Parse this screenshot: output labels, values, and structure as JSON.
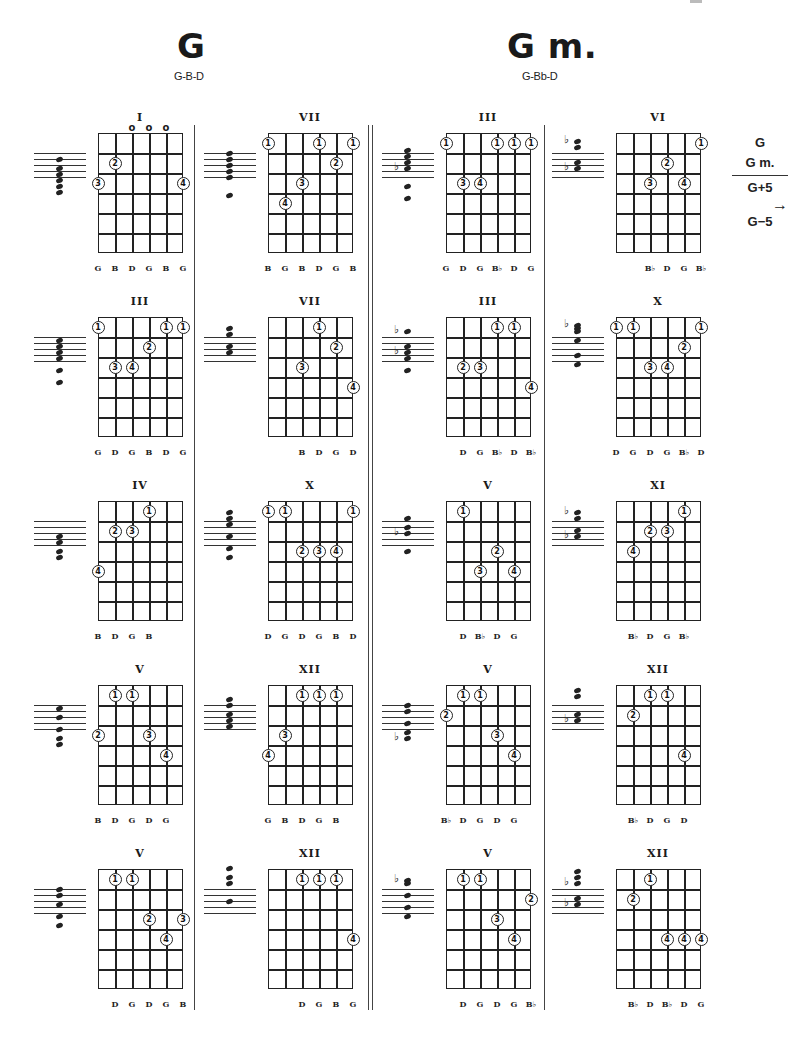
{
  "page": {
    "sections": [
      {
        "title": "G",
        "notes": "G-B-D"
      },
      {
        "title": "G m.",
        "notes": "G-Bb-D"
      }
    ],
    "legend": {
      "items": [
        "G",
        "G m.",
        "G+5",
        "G−5"
      ],
      "arrow": "→",
      "arrow_icon": "right-arrow-icon"
    }
  },
  "layout": {
    "columns_x": [
      98,
      268,
      446,
      616
    ],
    "rows_y": [
      133,
      317,
      501,
      685,
      869
    ],
    "grid_w": 85,
    "grid_h": 120,
    "strings": 6,
    "frets": 6
  },
  "diagrams": [
    {
      "col": 0,
      "row": 0,
      "section": "G",
      "position": "I",
      "open": [
        2,
        3,
        4
      ],
      "fingers": [
        {
          "s": 1,
          "f": 2,
          "n": "2"
        },
        {
          "s": 0,
          "f": 3,
          "n": "3"
        },
        {
          "s": 5,
          "f": 3,
          "n": "4"
        }
      ],
      "notes": [
        "G",
        "B",
        "D",
        "G",
        "B",
        "G"
      ],
      "notes_start": 0,
      "staff": {
        "heads": [
          2,
          5,
          7,
          9,
          11,
          13
        ],
        "flats": []
      }
    },
    {
      "col": 0,
      "row": 1,
      "section": "G",
      "position": "III",
      "open": [],
      "fingers": [
        {
          "s": 0,
          "f": 1,
          "n": "1"
        },
        {
          "s": 4,
          "f": 1,
          "n": "1"
        },
        {
          "s": 5,
          "f": 1,
          "n": "1"
        },
        {
          "s": 3,
          "f": 2,
          "n": "2"
        },
        {
          "s": 1,
          "f": 3,
          "n": "3"
        },
        {
          "s": 2,
          "f": 3,
          "n": "4"
        }
      ],
      "notes": [
        "G",
        "D",
        "G",
        "B",
        "D",
        "G"
      ],
      "notes_start": 0,
      "staff": {
        "heads": [
          1,
          3,
          5,
          7,
          11,
          15
        ],
        "flats": []
      }
    },
    {
      "col": 0,
      "row": 2,
      "section": "G",
      "position": "IV",
      "open": [],
      "fingers": [
        {
          "s": 3,
          "f": 1,
          "n": "1"
        },
        {
          "s": 1,
          "f": 2,
          "n": "2"
        },
        {
          "s": 2,
          "f": 2,
          "n": "3"
        },
        {
          "s": 0,
          "f": 4,
          "n": "4"
        }
      ],
      "notes": [
        "B",
        "D",
        "G",
        "B"
      ],
      "notes_start": 0,
      "staff": {
        "heads": [
          5,
          7,
          10,
          12
        ],
        "flats": []
      }
    },
    {
      "col": 0,
      "row": 3,
      "section": "G",
      "position": "V",
      "open": [],
      "fingers": [
        {
          "s": 1,
          "f": 1,
          "n": "1"
        },
        {
          "s": 2,
          "f": 1,
          "n": "1"
        },
        {
          "s": 0,
          "f": 3,
          "n": "2"
        },
        {
          "s": 3,
          "f": 3,
          "n": "3"
        },
        {
          "s": 4,
          "f": 4,
          "n": "4"
        }
      ],
      "notes": [
        "B",
        "D",
        "G",
        "D",
        "G"
      ],
      "notes_start": 0,
      "staff": {
        "heads": [
          1,
          4,
          8,
          11,
          13
        ],
        "flats": []
      }
    },
    {
      "col": 0,
      "row": 4,
      "section": "G",
      "position": "V",
      "open": [],
      "fingers": [
        {
          "s": 1,
          "f": 1,
          "n": "1"
        },
        {
          "s": 2,
          "f": 1,
          "n": "1"
        },
        {
          "s": 3,
          "f": 3,
          "n": "2"
        },
        {
          "s": 5,
          "f": 3,
          "n": "3"
        },
        {
          "s": 4,
          "f": 4,
          "n": "4"
        }
      ],
      "notes": [
        "D",
        "G",
        "D",
        "G",
        "B"
      ],
      "notes_start": 1,
      "staff": {
        "heads": [
          0,
          2,
          5,
          9,
          12
        ],
        "flats": []
      }
    },
    {
      "col": 1,
      "row": 0,
      "section": "G",
      "position": "VII",
      "open": [],
      "fingers": [
        {
          "s": 0,
          "f": 1,
          "n": "1"
        },
        {
          "s": 3,
          "f": 1,
          "n": "1"
        },
        {
          "s": 5,
          "f": 1,
          "n": "1"
        },
        {
          "s": 4,
          "f": 2,
          "n": "2"
        },
        {
          "s": 2,
          "f": 3,
          "n": "3"
        },
        {
          "s": 1,
          "f": 4,
          "n": "4"
        }
      ],
      "notes": [
        "B",
        "G",
        "B",
        "D",
        "G",
        "B"
      ],
      "notes_start": 0,
      "staff": {
        "heads": [
          0,
          2,
          4,
          6,
          8,
          14
        ],
        "flats": []
      }
    },
    {
      "col": 1,
      "row": 1,
      "section": "G",
      "position": "VII",
      "open": [],
      "fingers": [
        {
          "s": 3,
          "f": 1,
          "n": "1"
        },
        {
          "s": 4,
          "f": 2,
          "n": "2"
        },
        {
          "s": 2,
          "f": 3,
          "n": "3"
        },
        {
          "s": 5,
          "f": 4,
          "n": "4"
        }
      ],
      "notes": [
        "B",
        "D",
        "G",
        "D"
      ],
      "notes_start": 2,
      "staff": {
        "heads": [
          -3,
          -1,
          3,
          5
        ],
        "flats": []
      }
    },
    {
      "col": 1,
      "row": 2,
      "section": "G",
      "position": "X",
      "open": [],
      "fingers": [
        {
          "s": 0,
          "f": 1,
          "n": "1"
        },
        {
          "s": 1,
          "f": 1,
          "n": "1"
        },
        {
          "s": 5,
          "f": 1,
          "n": "1"
        },
        {
          "s": 2,
          "f": 3,
          "n": "2"
        },
        {
          "s": 3,
          "f": 3,
          "n": "3"
        },
        {
          "s": 4,
          "f": 3,
          "n": "4"
        }
      ],
      "notes": [
        "D",
        "G",
        "D",
        "G",
        "B",
        "D"
      ],
      "notes_start": 0,
      "staff": {
        "heads": [
          -3,
          -1,
          1,
          5,
          9,
          12
        ],
        "flats": []
      }
    },
    {
      "col": 1,
      "row": 3,
      "section": "G",
      "position": "XII",
      "open": [],
      "fingers": [
        {
          "s": 2,
          "f": 1,
          "n": "1"
        },
        {
          "s": 3,
          "f": 1,
          "n": "1"
        },
        {
          "s": 4,
          "f": 1,
          "n": "1"
        },
        {
          "s": 1,
          "f": 3,
          "n": "3"
        },
        {
          "s": 0,
          "f": 4,
          "n": "4"
        }
      ],
      "notes": [
        "G",
        "B",
        "D",
        "G",
        "B"
      ],
      "notes_start": 0,
      "staff": {
        "heads": [
          -2,
          0,
          3,
          5,
          7
        ],
        "flats": []
      }
    },
    {
      "col": 1,
      "row": 4,
      "section": "G",
      "position": "XII",
      "open": [],
      "fingers": [
        {
          "s": 2,
          "f": 1,
          "n": "1"
        },
        {
          "s": 3,
          "f": 1,
          "n": "1"
        },
        {
          "s": 4,
          "f": 1,
          "n": "1"
        },
        {
          "s": 5,
          "f": 4,
          "n": "4"
        }
      ],
      "notes": [
        "D",
        "G",
        "B",
        "G"
      ],
      "notes_start": 2,
      "staff": {
        "heads": [
          -7,
          -4,
          -2,
          4
        ],
        "flats": []
      }
    },
    {
      "col": 2,
      "row": 0,
      "section": "G m.",
      "position": "III",
      "open": [],
      "fingers": [
        {
          "s": 0,
          "f": 1,
          "n": "1"
        },
        {
          "s": 3,
          "f": 1,
          "n": "1"
        },
        {
          "s": 4,
          "f": 1,
          "n": "1"
        },
        {
          "s": 5,
          "f": 1,
          "n": "1"
        },
        {
          "s": 1,
          "f": 3,
          "n": "3"
        },
        {
          "s": 2,
          "f": 3,
          "n": "4"
        }
      ],
      "notes": [
        "G",
        "D",
        "G",
        "Bb",
        "D",
        "G"
      ],
      "notes_start": 0,
      "staff": {
        "heads": [
          -1,
          1,
          3,
          5,
          11,
          15
        ],
        "flats": [
          5
        ]
      }
    },
    {
      "col": 2,
      "row": 1,
      "section": "G m.",
      "position": "III",
      "open": [],
      "fingers": [
        {
          "s": 3,
          "f": 1,
          "n": "1"
        },
        {
          "s": 4,
          "f": 1,
          "n": "1"
        },
        {
          "s": 1,
          "f": 3,
          "n": "2"
        },
        {
          "s": 2,
          "f": 3,
          "n": "3"
        },
        {
          "s": 5,
          "f": 4,
          "n": "4"
        }
      ],
      "notes": [
        "D",
        "G",
        "Bb",
        "D",
        "Bb"
      ],
      "notes_start": 1,
      "staff": {
        "heads": [
          -2,
          3,
          5,
          7,
          11
        ],
        "flats": [
          -2,
          5
        ]
      }
    },
    {
      "col": 2,
      "row": 2,
      "section": "G m.",
      "position": "V",
      "open": [],
      "fingers": [
        {
          "s": 1,
          "f": 1,
          "n": "1"
        },
        {
          "s": 3,
          "f": 3,
          "n": "2"
        },
        {
          "s": 2,
          "f": 4,
          "n": "3"
        },
        {
          "s": 4,
          "f": 4,
          "n": "4"
        }
      ],
      "notes": [
        "D",
        "Bb",
        "D",
        "G"
      ],
      "notes_start": 1,
      "staff": {
        "heads": [
          -1,
          2,
          4,
          10
        ],
        "flats": [
          4
        ]
      }
    },
    {
      "col": 2,
      "row": 3,
      "section": "G m.",
      "position": "V",
      "open": [],
      "fingers": [
        {
          "s": 1,
          "f": 1,
          "n": "1"
        },
        {
          "s": 2,
          "f": 1,
          "n": "1"
        },
        {
          "s": 0,
          "f": 2,
          "n": "2"
        },
        {
          "s": 3,
          "f": 3,
          "n": "3"
        },
        {
          "s": 4,
          "f": 4,
          "n": "4"
        }
      ],
      "notes": [
        "Bb",
        "D",
        "G",
        "D",
        "G"
      ],
      "notes_start": 0,
      "staff": {
        "heads": [
          0,
          2,
          6,
          9,
          11
        ],
        "flats": [
          11
        ]
      }
    },
    {
      "col": 2,
      "row": 4,
      "section": "G m.",
      "position": "V",
      "open": [],
      "fingers": [
        {
          "s": 1,
          "f": 1,
          "n": "1"
        },
        {
          "s": 2,
          "f": 1,
          "n": "1"
        },
        {
          "s": 5,
          "f": 2,
          "n": "2"
        },
        {
          "s": 3,
          "f": 3,
          "n": "3"
        },
        {
          "s": 4,
          "f": 4,
          "n": "4"
        }
      ],
      "notes": [
        "D",
        "G",
        "D",
        "G",
        "Bb"
      ],
      "notes_start": 1,
      "staff": {
        "heads": [
          -3,
          -2,
          2,
          6,
          9
        ],
        "flats": [
          -3
        ]
      }
    },
    {
      "col": 3,
      "row": 0,
      "section": "G m.",
      "position": "VI",
      "open": [],
      "fingers": [
        {
          "s": 5,
          "f": 1,
          "n": "1"
        },
        {
          "s": 3,
          "f": 2,
          "n": "2"
        },
        {
          "s": 2,
          "f": 3,
          "n": "3"
        },
        {
          "s": 4,
          "f": 3,
          "n": "4"
        }
      ],
      "notes": [
        "Bb",
        "D",
        "G",
        "Bb"
      ],
      "notes_start": 2,
      "staff": {
        "heads": [
          -4,
          -2,
          3,
          5
        ],
        "flats": [
          -4,
          5
        ]
      }
    },
    {
      "col": 3,
      "row": 1,
      "section": "G m.",
      "position": "X",
      "open": [],
      "fingers": [
        {
          "s": 0,
          "f": 1,
          "n": "1"
        },
        {
          "s": 1,
          "f": 1,
          "n": "1"
        },
        {
          "s": 5,
          "f": 1,
          "n": "1"
        },
        {
          "s": 4,
          "f": 2,
          "n": "2"
        },
        {
          "s": 2,
          "f": 3,
          "n": "3"
        },
        {
          "s": 3,
          "f": 3,
          "n": "4"
        }
      ],
      "notes": [
        "D",
        "G",
        "D",
        "G",
        "Bb",
        "D"
      ],
      "notes_start": 0,
      "staff": {
        "heads": [
          -4,
          -3,
          -2,
          1,
          6,
          9
        ],
        "flats": [
          -4
        ]
      }
    },
    {
      "col": 3,
      "row": 2,
      "section": "G m.",
      "position": "XI",
      "open": [],
      "fingers": [
        {
          "s": 4,
          "f": 1,
          "n": "1"
        },
        {
          "s": 2,
          "f": 2,
          "n": "2"
        },
        {
          "s": 3,
          "f": 2,
          "n": "3"
        },
        {
          "s": 1,
          "f": 3,
          "n": "4"
        }
      ],
      "notes": [
        "Bb",
        "D",
        "G",
        "Bb"
      ],
      "notes_start": 1,
      "staff": {
        "heads": [
          -3,
          -1,
          3,
          5
        ],
        "flats": [
          -3,
          5
        ]
      }
    },
    {
      "col": 3,
      "row": 3,
      "section": "G m.",
      "position": "XII",
      "open": [],
      "fingers": [
        {
          "s": 2,
          "f": 1,
          "n": "1"
        },
        {
          "s": 3,
          "f": 1,
          "n": "1"
        },
        {
          "s": 1,
          "f": 2,
          "n": "2"
        },
        {
          "s": 4,
          "f": 4,
          "n": "4"
        }
      ],
      "notes": [
        "Bb",
        "D",
        "G",
        "D"
      ],
      "notes_start": 1,
      "staff": {
        "heads": [
          -5,
          -3,
          3,
          5
        ],
        "flats": [
          5
        ]
      }
    },
    {
      "col": 3,
      "row": 4,
      "section": "G m.",
      "position": "XII",
      "open": [],
      "fingers": [
        {
          "s": 2,
          "f": 1,
          "n": "1"
        },
        {
          "s": 1,
          "f": 2,
          "n": "2"
        },
        {
          "s": 3,
          "f": 4,
          "n": "4"
        },
        {
          "s": 4,
          "f": 4,
          "n": "4"
        },
        {
          "s": 5,
          "f": 4,
          "n": "4"
        }
      ],
      "notes": [
        "Bb",
        "D",
        "Bb",
        "D",
        "G"
      ],
      "notes_start": 1,
      "staff": {
        "heads": [
          -6,
          -4,
          -2,
          3,
          5
        ],
        "flats": [
          -2,
          5
        ]
      }
    }
  ]
}
